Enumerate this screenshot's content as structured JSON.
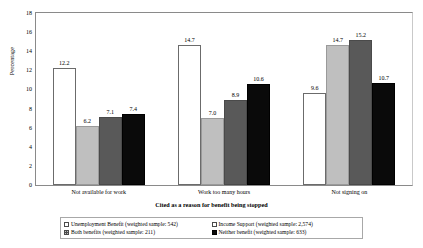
{
  "chart_data": {
    "type": "bar",
    "title": "",
    "xlabel": "Cited as a reason for benefit being stopped",
    "ylabel": "Percentage",
    "categories": [
      "Not available for work",
      "Work too many hours",
      "Not signing on"
    ],
    "ylim": [
      0,
      18
    ],
    "yticks": [
      0,
      2,
      4,
      6,
      8,
      10,
      12,
      14,
      16,
      18
    ],
    "ytick_labels": [
      "0",
      "2",
      "4",
      "6",
      "8",
      "10",
      "12",
      "14",
      "16",
      "18"
    ],
    "grid": false,
    "legend_position": "bottom",
    "series": [
      {
        "name": "Unemployment Benefit (weighted sample: 542)",
        "color": "#ffffff",
        "values": [
          12.2,
          14.7,
          9.6
        ],
        "labels": [
          "12.2",
          "14.7",
          "9.6"
        ]
      },
      {
        "name": "Income Support (weighted sample: 2,574)",
        "color": "#bfbfbf",
        "values": [
          6.2,
          7.0,
          14.7
        ],
        "labels": [
          "6.2",
          "7.0",
          "14.7"
        ]
      },
      {
        "name": "Both benefits (weighted sample: 211)",
        "color": "#595959",
        "values": [
          7.1,
          8.9,
          15.2
        ],
        "labels": [
          "7.1",
          "8.9",
          "15.2"
        ]
      },
      {
        "name": "Neither benefit (weighted sample: 633)",
        "color": "#0a0a0a",
        "values": [
          7.4,
          10.6,
          10.7
        ],
        "labels": [
          "7.4",
          "10.6",
          "10.7"
        ]
      }
    ]
  },
  "legend": {
    "entries": [
      {
        "label": "Unemployment Benefit (weighted sample: 542)",
        "swatch": "legend-swatch-unemployment-benefit"
      },
      {
        "label": "Income Support (weighted sample: 2,574)",
        "swatch": "legend-swatch-income-support"
      },
      {
        "label": "Both benefits (weighted sample: 211)",
        "swatch": "legend-swatch-both-benefits"
      },
      {
        "label": "Neither benefit (weighted sample: 633)",
        "swatch": "legend-swatch-neither-benefit"
      }
    ]
  }
}
